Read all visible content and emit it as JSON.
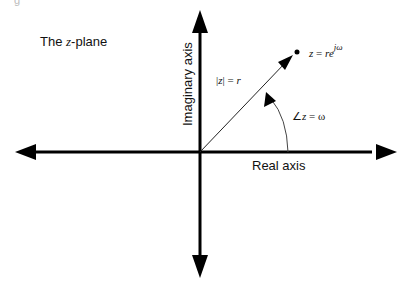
{
  "diagram": {
    "title": {
      "prefix": "The ",
      "variable": "z",
      "suffix": "-plane"
    },
    "axes": {
      "imaginary_label": "Imaginary axis",
      "real_label": "Real axis",
      "origin": [
        200,
        152
      ]
    },
    "vector": {
      "magnitude_label": {
        "lhs_open": "|",
        "var": "z",
        "lhs_close": "|",
        "eq": " = ",
        "rhs": "r"
      },
      "point_label": {
        "var": "z",
        "eq": " = ",
        "r": "r",
        "e": "e",
        "exponent": "jω"
      },
      "endpoint": [
        297,
        52
      ]
    },
    "angle": {
      "symbol": "∠",
      "var": "z",
      "eq": " = ",
      "rhs": "ω"
    },
    "colors": {
      "stroke": "#000000",
      "background": "#ffffff",
      "arc": "#444444"
    },
    "corner_artifact": "g"
  }
}
